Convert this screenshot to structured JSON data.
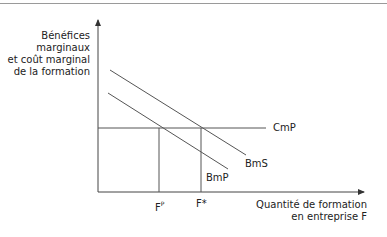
{
  "diagram": {
    "y_axis_label": [
      "Bénéfices",
      "marginaux",
      "et coût marginal",
      "de la formation"
    ],
    "x_axis_label": [
      "Quantité de formation",
      "en entreprise F"
    ],
    "curves": [
      {
        "name": "BmS",
        "label": "BmS"
      },
      {
        "name": "BmP",
        "label": "BmP"
      },
      {
        "name": "CmP",
        "label": "CmP"
      }
    ],
    "ticks": {
      "fp_base": "F",
      "fp_sup": "P",
      "fstar": "F*"
    },
    "colors": {
      "line": "#555555",
      "axis": "#444444",
      "rule": "#9a9a9a"
    }
  }
}
